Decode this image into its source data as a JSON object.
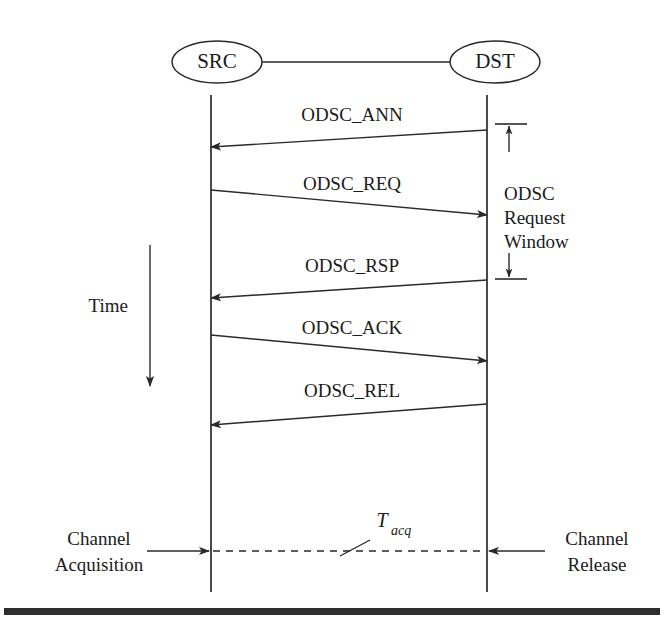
{
  "figure": {
    "type": "sequence-diagram",
    "title_visible": false,
    "background_color": "#ffffff",
    "line_color": "#2a2a2a",
    "text_color": "#1b1b1b"
  },
  "nodes": [
    {
      "id": "src",
      "label": "SRC",
      "cx": 217,
      "cy": 62,
      "rx": 45,
      "ry": 21,
      "lifeline_x": 211
    },
    {
      "id": "dst",
      "label": "DST",
      "cx": 495,
      "cy": 62,
      "rx": 45,
      "ry": 21,
      "lifeline_x": 487
    }
  ],
  "connector": {
    "from_x": 262,
    "from_y": 62,
    "to_x": 450,
    "to_y": 62
  },
  "lifelines": {
    "top_y": 95,
    "bottom_y": 592
  },
  "messages": [
    {
      "id": "odsc-ann",
      "label": "ODSC_ANN",
      "direction": "dst-to-src",
      "from_x": 487,
      "from_y": 130,
      "to_x": 211,
      "to_y": 147,
      "label_x": 352,
      "label_y": 121
    },
    {
      "id": "odsc-req",
      "label": "ODSC_REQ",
      "direction": "src-to-dst",
      "from_x": 211,
      "from_y": 190,
      "to_x": 487,
      "to_y": 215,
      "label_x": 352,
      "label_y": 190
    },
    {
      "id": "odsc-rsp",
      "label": "ODSC_RSP",
      "direction": "dst-to-src",
      "from_x": 487,
      "from_y": 280,
      "to_x": 211,
      "to_y": 298,
      "label_x": 352,
      "label_y": 272
    },
    {
      "id": "odsc-ack",
      "label": "ODSC_ACK",
      "direction": "src-to-dst",
      "from_x": 211,
      "from_y": 335,
      "to_x": 487,
      "to_y": 361,
      "label_x": 352,
      "label_y": 334
    },
    {
      "id": "odsc-rel",
      "label": "ODSC_REL",
      "direction": "dst-to-src",
      "from_x": 487,
      "from_y": 404,
      "to_x": 211,
      "to_y": 425,
      "label_x": 352,
      "label_y": 397
    }
  ],
  "annotations": {
    "request_window": {
      "id": "odsc-request-window",
      "label_lines": [
        "ODSC",
        "Request",
        "Window"
      ],
      "label_x": 520,
      "label_line_y": [
        200,
        224,
        248
      ],
      "arrow_x": 509,
      "top_y": 124,
      "bottom_y": 279,
      "cap_top_x1": 495,
      "cap_top_x2": 527,
      "cap_bottom_x1": 495,
      "cap_bottom_x2": 527
    },
    "time_arrow": {
      "id": "time-arrow",
      "label": "Time",
      "label_x": 103,
      "label_y": 312,
      "x": 150,
      "top_y": 245,
      "bottom_y": 388
    },
    "tacq": {
      "id": "tacq-label",
      "base": "T",
      "subscript": "acq",
      "base_x": 382,
      "base_y": 527,
      "sub_x": 392,
      "sub_y": 534,
      "leader_x1": 370,
      "leader_y1": 540,
      "leader_x2": 340,
      "leader_y2": 556
    },
    "channel_acquisition": {
      "id": "channel-acquisition",
      "label_lines": [
        "Channel",
        "Acquisition"
      ],
      "label_x": 99,
      "label_line_y": [
        545,
        571
      ],
      "arrow_from_x": 147,
      "arrow_to_x": 209,
      "arrow_y": 551
    },
    "channel_release": {
      "id": "channel-release",
      "label_lines": [
        "Channel",
        "Release"
      ],
      "label_x": 552,
      "label_line_y": [
        545,
        571
      ],
      "arrow_from_x": 545,
      "arrow_to_x": 489,
      "arrow_y": 551
    },
    "tacq_span": {
      "id": "tacq-dashed-span",
      "from_x": 213,
      "to_x": 485,
      "y": 551
    }
  },
  "bottom_rule": {
    "x": 4,
    "y": 608,
    "width": 656,
    "height": 7
  }
}
